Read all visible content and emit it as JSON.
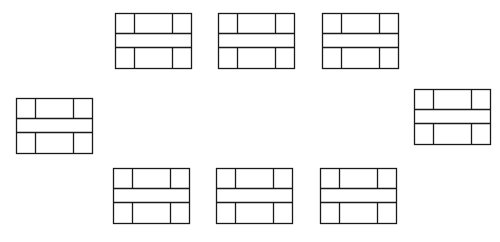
{
  "diagram": {
    "stroke_color": "#1a1a1a",
    "background": "#ffffff",
    "box_size": {
      "width": 76,
      "height": 55
    },
    "row_lines": [
      20,
      34
    ],
    "col_lines": [
      19,
      57
    ],
    "boxes": [
      {
        "id": "box-top-1",
        "x": 115,
        "y": 13
      },
      {
        "id": "box-top-2",
        "x": 218,
        "y": 13
      },
      {
        "id": "box-top-3",
        "x": 322,
        "y": 13
      },
      {
        "id": "box-left",
        "x": 16,
        "y": 98
      },
      {
        "id": "box-right",
        "x": 414,
        "y": 89
      },
      {
        "id": "box-bottom-1",
        "x": 113,
        "y": 168
      },
      {
        "id": "box-bottom-2",
        "x": 216,
        "y": 168
      },
      {
        "id": "box-bottom-3",
        "x": 320,
        "y": 168
      }
    ]
  }
}
